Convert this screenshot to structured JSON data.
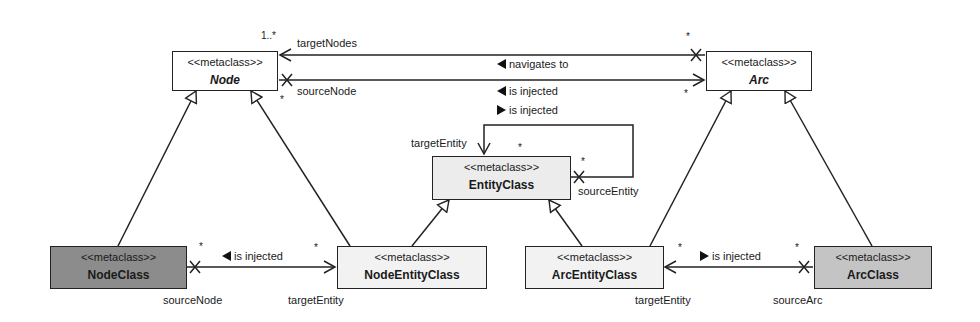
{
  "classes": {
    "node": {
      "stereotype": "<<metaclass>>",
      "name": "Node",
      "fill": "#ffffff",
      "abstract": true
    },
    "arc": {
      "stereotype": "<<metaclass>>",
      "name": "Arc",
      "fill": "#ffffff",
      "abstract": true
    },
    "entity_class": {
      "stereotype": "<<metaclass>>",
      "name": "EntityClass",
      "fill": "#ececec"
    },
    "node_class": {
      "stereotype": "<<metaclass>>",
      "name": "NodeClass",
      "fill": "#8c8c8c"
    },
    "node_entity_class": {
      "stereotype": "<<metaclass>>",
      "name": "NodeEntityClass",
      "fill": "#f2f2f2"
    },
    "arc_entity_class": {
      "stereotype": "<<metaclass>>",
      "name": "ArcEntityClass",
      "fill": "#f2f2f2"
    },
    "arc_class": {
      "stereotype": "<<metaclass>>",
      "name": "ArcClass",
      "fill": "#c4c4c4"
    }
  },
  "associations": {
    "target_nodes": {
      "role": "targetNodes",
      "mult_node": "1..*",
      "mult_arc": "*"
    },
    "source_node_top": {
      "role": "sourceNode",
      "mult_node": "*",
      "mult_arc": "*"
    },
    "navigates_to": {
      "label": "navigates to",
      "direction": "left"
    },
    "is_injected_left": {
      "label": "is injected",
      "direction": "left"
    },
    "is_injected_right": {
      "label": "is injected",
      "direction": "right"
    },
    "self_loop": {
      "target_role": "targetEntity",
      "source_role": "sourceEntity",
      "mult_target": "*",
      "mult_source": "*"
    },
    "node_injection": {
      "label": "is injected",
      "direction": "left",
      "source_role": "sourceNode",
      "target_role": "targetEntity",
      "mult_source": "*",
      "mult_target": "*"
    },
    "arc_injection": {
      "label": "is injected",
      "direction": "right",
      "source_role": "sourceArc",
      "target_role": "targetEntity",
      "mult_source": "*",
      "mult_target": "*"
    }
  }
}
